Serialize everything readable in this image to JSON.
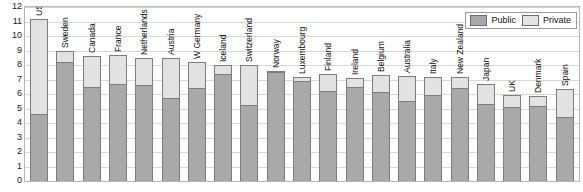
{
  "chart_data": {
    "type": "bar",
    "subtype": "stacked-bar",
    "title": "",
    "xlabel": "",
    "ylabel": "",
    "ylim": [
      0,
      12
    ],
    "ytick_labels": [
      "0",
      "1",
      "2",
      "3",
      "4",
      "5",
      "6",
      "7",
      "8",
      "9",
      "10",
      "11",
      "12"
    ],
    "ytick_values": [
      0,
      1,
      2,
      3,
      4,
      5,
      6,
      7,
      8,
      9,
      10,
      11,
      12
    ],
    "grid": true,
    "legend_position": "top-right",
    "categories": [
      "US",
      "Sweden",
      "Canada",
      "France",
      "Netherlands",
      "Austria",
      "W Germany",
      "Iceland",
      "Switzerland",
      "Norway",
      "Luxembourg",
      "Finland",
      "Ireland",
      "Belgium",
      "Australia",
      "Italy",
      "New Zealand",
      "Japan",
      "UK",
      "Denmark",
      "Spain"
    ],
    "series": [
      {
        "name": "Public",
        "color": "#a9a9a9",
        "values": [
          4.6,
          8.2,
          6.5,
          6.7,
          6.65,
          5.75,
          6.4,
          7.4,
          5.25,
          7.5,
          6.9,
          6.2,
          6.5,
          6.15,
          5.5,
          5.9,
          6.4,
          5.3,
          5.1,
          5.15,
          4.4
        ]
      },
      {
        "name": "Private",
        "color": "#e2e2e2",
        "values": [
          6.6,
          0.8,
          2.15,
          2.0,
          1.85,
          2.7,
          1.8,
          0.6,
          2.75,
          0.1,
          0.25,
          1.2,
          0.6,
          1.15,
          1.75,
          1.25,
          0.8,
          1.4,
          0.85,
          0.7,
          1.95
        ]
      }
    ],
    "totals": [
      11.2,
      9.0,
      8.65,
      8.7,
      8.5,
      8.45,
      8.2,
      8.0,
      8.0,
      7.6,
      7.15,
      7.4,
      7.1,
      7.3,
      7.25,
      7.15,
      7.2,
      6.7,
      5.95,
      5.85,
      6.35
    ]
  },
  "legend": {
    "items": [
      {
        "label": "Public",
        "swatch": "public-swatch"
      },
      {
        "label": "Private",
        "swatch": "private-swatch"
      }
    ]
  }
}
